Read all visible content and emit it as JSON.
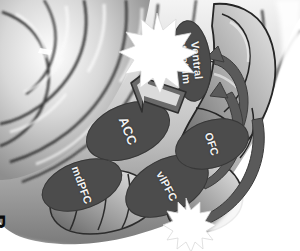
{
  "figure": {
    "panel_label": "B",
    "orientation_note": "rotated",
    "background": "brain-lateral-surface-grayscale",
    "colors": {
      "region_fill": "#4c4c4c",
      "region_label": "#f2f2f2",
      "arrow_fill": "#5a5a5a",
      "arrow_outline": "#3a3a3a",
      "burst_fill": "#ffffff",
      "panel_letter": "#0b0b0b",
      "page_background": "#ffffff"
    }
  },
  "regions": [
    {
      "id": "acc",
      "label": "ACC"
    },
    {
      "id": "mdpfc",
      "label": "mdPFC"
    },
    {
      "id": "vlpfc",
      "label": "vlPFC"
    },
    {
      "id": "ofc",
      "label": "OFC"
    },
    {
      "id": "vs",
      "label": "Ventral\nstriatum"
    }
  ],
  "annotations": {
    "burst_top": "activation-burst",
    "burst_bottom": "activation-burst",
    "arrow_acc_to_burst": "block-arrow",
    "arrow_vs_inbound": "curved-arrow",
    "arrow_ofc_loop": "curved-arrow",
    "arrow_vlpfc_loop": "curved-arrow"
  }
}
